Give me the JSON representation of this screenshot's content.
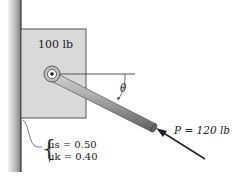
{
  "figure": {
    "block": {
      "weight_label": "100 lb"
    },
    "force": {
      "label": "P = 120 lb"
    },
    "angle": {
      "label": "θ"
    },
    "friction": {
      "static": "μs = 0.50",
      "kinetic": "μk = 0.40"
    },
    "colors": {
      "wall": "#9a9a9a",
      "block": "#d7d7d7",
      "rod": "#8c8c8c",
      "line": "#222222"
    }
  }
}
